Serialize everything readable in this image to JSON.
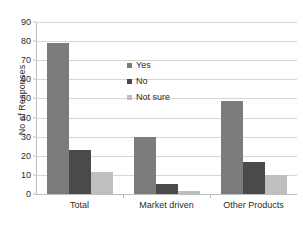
{
  "chart_data": {
    "type": "bar",
    "title": "",
    "xlabel": "",
    "ylabel": "No of Responses",
    "ylim": [
      0,
      90
    ],
    "yticks": [
      0,
      10,
      20,
      30,
      40,
      50,
      60,
      70,
      80,
      90
    ],
    "grid": true,
    "legend_position": "inside-upper-center",
    "categories": [
      "Total",
      "Market driven",
      "Other Products"
    ],
    "series": [
      {
        "name": "Yes",
        "color": "#7c7c7c",
        "values": [
          79,
          30,
          48.5
        ]
      },
      {
        "name": "No",
        "color": "#4a4a4a",
        "values": [
          23,
          5,
          17
        ]
      },
      {
        "name": "Not sure",
        "color": "#bfbfbf",
        "values": [
          11.5,
          1.5,
          10
        ]
      }
    ]
  },
  "axis": {
    "y_title": "No of Responses",
    "tick_labels": [
      "0",
      "10",
      "20",
      "30",
      "40",
      "50",
      "60",
      "70",
      "80",
      "90"
    ],
    "category_labels": [
      "Total",
      "Market driven",
      "Other Products"
    ]
  },
  "legend": {
    "items": [
      {
        "label": "Yes"
      },
      {
        "label": "No"
      },
      {
        "label": "Not sure"
      }
    ]
  },
  "colors": {
    "yes": "#7c7c7c",
    "no": "#4a4a4a",
    "not_sure": "#bfbfbf",
    "gridline": "#d6d6d6",
    "axis": "#bdbdbd",
    "text": "#2b2b2b",
    "background": "#ffffff"
  }
}
